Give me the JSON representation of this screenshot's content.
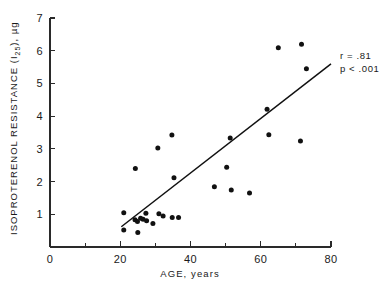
{
  "chart_data": {
    "type": "scatter",
    "title": "",
    "xlabel": "AGE, years",
    "ylabel": "ISOPROTERENOL RESISTANCE (I25), µg",
    "ylabel_main": "ISOPROTERENOL  RESISTANCE  (I",
    "ylabel_subscript": "25",
    "ylabel_tail": "), µg",
    "xlim": [
      0,
      80
    ],
    "ylim": [
      0,
      7
    ],
    "xticks": [
      0,
      20,
      40,
      60,
      80
    ],
    "xticklabels": [
      "0",
      "20",
      "40",
      "60",
      "80"
    ],
    "xminorticks": [
      10,
      30,
      50,
      70
    ],
    "yticks": [
      1,
      2,
      3,
      4,
      5,
      6,
      7
    ],
    "yticklabels": [
      "1",
      "2",
      "3",
      "4",
      "5",
      "6",
      "7"
    ],
    "grid": false,
    "legend": null,
    "marker": "filled-circle",
    "marker_color": "#111111",
    "points": [
      {
        "x": 21.0,
        "y": 1.05
      },
      {
        "x": 21.0,
        "y": 0.52
      },
      {
        "x": 24.3,
        "y": 2.4
      },
      {
        "x": 24.2,
        "y": 0.83
      },
      {
        "x": 24.9,
        "y": 0.78
      },
      {
        "x": 25.0,
        "y": 0.44
      },
      {
        "x": 25.8,
        "y": 0.88
      },
      {
        "x": 26.5,
        "y": 0.85
      },
      {
        "x": 27.3,
        "y": 1.03
      },
      {
        "x": 27.5,
        "y": 0.8
      },
      {
        "x": 29.3,
        "y": 0.72
      },
      {
        "x": 30.7,
        "y": 3.03
      },
      {
        "x": 31.0,
        "y": 1.02
      },
      {
        "x": 32.2,
        "y": 0.95
      },
      {
        "x": 34.7,
        "y": 3.42
      },
      {
        "x": 34.8,
        "y": 0.9
      },
      {
        "x": 35.3,
        "y": 2.12
      },
      {
        "x": 36.6,
        "y": 0.9
      },
      {
        "x": 46.8,
        "y": 1.84
      },
      {
        "x": 50.3,
        "y": 2.44
      },
      {
        "x": 51.3,
        "y": 3.33
      },
      {
        "x": 51.6,
        "y": 1.74
      },
      {
        "x": 56.8,
        "y": 1.65
      },
      {
        "x": 61.8,
        "y": 4.21
      },
      {
        "x": 62.3,
        "y": 3.43
      },
      {
        "x": 65.0,
        "y": 6.09
      },
      {
        "x": 71.3,
        "y": 3.24
      },
      {
        "x": 71.6,
        "y": 6.2
      },
      {
        "x": 73.0,
        "y": 5.45
      }
    ],
    "fitline": {
      "x1": 20.3,
      "y1": 0.62,
      "x2": 80.0,
      "y2": 5.6
    },
    "annotations": [
      {
        "text": "r = .81"
      },
      {
        "text": "p < .001"
      }
    ]
  }
}
